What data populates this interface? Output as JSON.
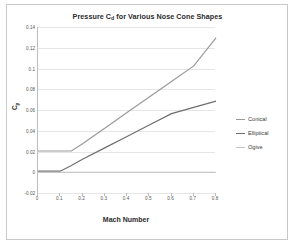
{
  "chart_data": {
    "type": "line",
    "title_main": "Pressure C",
    "title_sub": "d",
    "title_rest": " for Various Nose Cone Shapes",
    "xlabel": "Mach Number",
    "ylabel": "C_p",
    "ylabel_main": "C",
    "ylabel_sub": "p",
    "xlim": [
      0,
      0.8
    ],
    "ylim": [
      -0.02,
      0.14
    ],
    "xticks": [
      "0",
      "0.1",
      "0.2",
      "0.3",
      "0.4",
      "0.5",
      "0.6",
      "0.7",
      "0.8"
    ],
    "xtick_values": [
      0,
      0.1,
      0.2,
      0.3,
      0.4,
      0.5,
      0.6,
      0.7,
      0.8
    ],
    "yticks": [
      "0.14",
      "0.12",
      "0.1",
      "0.08",
      "0.06",
      "0.04",
      "0.02",
      "0",
      "-0.02"
    ],
    "ytick_values": [
      0.14,
      0.12,
      0.1,
      0.08,
      0.06,
      0.04,
      0.02,
      0,
      -0.02
    ],
    "grid": true,
    "grid_axis": "y",
    "legend_position": "right",
    "series": [
      {
        "name": "Conical",
        "color": "#9a9a9a",
        "x": [
          0,
          0.05,
          0.1,
          0.15,
          0.2,
          0.3,
          0.4,
          0.5,
          0.6,
          0.7,
          0.8
        ],
        "values": [
          0.0205,
          0.0205,
          0.0205,
          0.0205,
          0.0275,
          0.0425,
          0.0575,
          0.0725,
          0.0875,
          0.1025,
          0.1295
        ]
      },
      {
        "name": "Elliptical",
        "color": "#6e6e6e",
        "x": [
          0,
          0.05,
          0.1,
          0.15,
          0.2,
          0.3,
          0.4,
          0.5,
          0.6,
          0.7,
          0.8
        ],
        "values": [
          0.001,
          0.001,
          0.001,
          0.0065,
          0.0125,
          0.0235,
          0.0345,
          0.0455,
          0.0565,
          0.0625,
          0.0685
        ]
      },
      {
        "name": "Ogive",
        "color": "#c4c4c4",
        "x": [
          0,
          0.1,
          0.2,
          0.3,
          0.4,
          0.5,
          0.6,
          0.7,
          0.8
        ],
        "values": [
          0,
          0,
          0,
          0,
          0,
          0,
          0,
          0,
          0
        ]
      }
    ]
  },
  "legend": {
    "items": [
      {
        "label": "Conical"
      },
      {
        "label": "Elliptical"
      },
      {
        "label": "Ogive"
      }
    ]
  }
}
